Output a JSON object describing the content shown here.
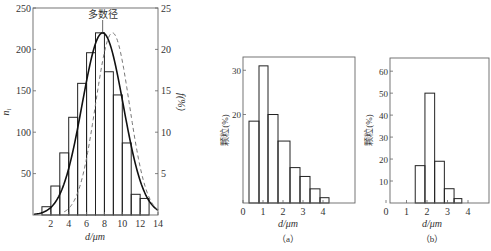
{
  "chart_data": [
    {
      "id": "left",
      "type": "bar",
      "subtype": "histogram-with-curves",
      "title": "",
      "annotation": "多数径",
      "annotation_x": 7.8,
      "xlabel": "d/μm",
      "ylabel": "n_i",
      "ylabel_right": "f(%)",
      "xlim": [
        0,
        14
      ],
      "ylim": [
        0,
        250
      ],
      "ylim_right": [
        0,
        25
      ],
      "xticks": [
        2,
        4,
        6,
        8,
        10,
        12,
        14
      ],
      "yticks": [
        50,
        100,
        150,
        200,
        250
      ],
      "yticks_right": [
        5,
        10,
        15,
        20,
        25
      ],
      "grid": false,
      "bins": [
        [
          1,
          2
        ],
        [
          2,
          3
        ],
        [
          3,
          4
        ],
        [
          4,
          5
        ],
        [
          5,
          6
        ],
        [
          6,
          7
        ],
        [
          7,
          8
        ],
        [
          8,
          9
        ],
        [
          9,
          10
        ],
        [
          10,
          11
        ],
        [
          11,
          12
        ],
        [
          12,
          13
        ]
      ],
      "values": [
        10,
        35,
        75,
        118,
        159,
        196,
        220,
        173,
        145,
        87,
        25,
        20
      ],
      "series": [
        {
          "name": "n_i histogram",
          "style": "bars",
          "values": [
            10,
            35,
            75,
            118,
            159,
            196,
            220,
            173,
            145,
            87,
            25,
            20
          ]
        },
        {
          "name": "number distribution curve",
          "style": "solid",
          "mean": 7.8,
          "sd": 2.3,
          "peak": 220
        },
        {
          "name": "f(%) curve",
          "style": "dashed",
          "mean": 8.9,
          "sd": 1.9,
          "peak": 22,
          "axis": "right"
        }
      ]
    },
    {
      "id": "a",
      "type": "bar",
      "caption": "（a）",
      "xlabel": "d/μm",
      "ylabel": "颗粒(%)",
      "xlim": [
        0,
        5.6
      ],
      "ylim": [
        0,
        33
      ],
      "xticks": [
        0,
        1,
        2,
        3,
        4
      ],
      "yticks": [
        20,
        30
      ],
      "grid": false,
      "bins": [
        [
          0.3,
          0.8
        ],
        [
          0.8,
          1.25
        ],
        [
          1.25,
          1.75
        ],
        [
          1.75,
          2.35
        ],
        [
          2.35,
          2.85
        ],
        [
          2.85,
          3.35
        ],
        [
          3.35,
          3.85
        ],
        [
          3.85,
          4.3
        ]
      ],
      "values": [
        18.5,
        31,
        20,
        14,
        8,
        6,
        3.2,
        1.2
      ]
    },
    {
      "id": "b",
      "type": "bar",
      "caption": "（b）",
      "xlabel": "d/μm",
      "ylabel": "颗粒(%)",
      "xlim": [
        0,
        5.1
      ],
      "ylim": [
        0,
        66
      ],
      "xticks": [
        0,
        1,
        2,
        3,
        4
      ],
      "yticks": [
        10,
        20,
        30,
        40,
        50,
        60
      ],
      "grid": false,
      "bins": [
        [
          1.3,
          1.8
        ],
        [
          1.8,
          2.3
        ],
        [
          2.3,
          2.8
        ],
        [
          2.8,
          3.3
        ],
        [
          3.3,
          3.7
        ]
      ],
      "values": [
        17,
        50,
        19,
        6.5,
        2
      ]
    }
  ],
  "labels": {
    "left_annotation": "多数径",
    "left_xlabel": "d/μm",
    "left_ylabel": "n_i",
    "left_ylabel_right": "f(%)",
    "a_ylabel": "颗粒(%)",
    "a_xlabel": "d/μm",
    "a_caption": "（a）",
    "b_ylabel": "颗粒(%)",
    "b_xlabel": "d/μm",
    "b_caption": "（b）"
  },
  "colors": {
    "axis": "#666666",
    "bar_stroke": "#222222",
    "curve": "#111111",
    "dashed": "#777777",
    "text": "#333333"
  }
}
